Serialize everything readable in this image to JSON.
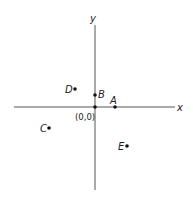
{
  "diagram": {
    "type": "coordinate-plane",
    "axes": {
      "x_label": "x",
      "y_label": "y",
      "origin_label": "(0,0)"
    },
    "points": [
      {
        "name": "A",
        "label": "A"
      },
      {
        "name": "B",
        "label": "B"
      },
      {
        "name": "C",
        "label": "C"
      },
      {
        "name": "D",
        "label": "D"
      },
      {
        "name": "E",
        "label": "E"
      }
    ]
  }
}
